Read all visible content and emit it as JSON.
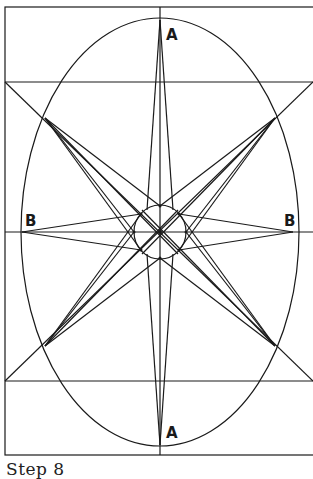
{
  "caption": "Step 8",
  "labels": {
    "top_point": "A",
    "bottom_point": "A",
    "left_point": "B",
    "right_point": "B"
  },
  "colors": {
    "stroke": "#1a1a1a",
    "background": "#ffffff"
  },
  "geometry": {
    "outer_rect": {
      "x1": 5,
      "y1": 7,
      "x2": 313,
      "y2": 455
    },
    "upper_band_y": 82,
    "lower_band_y": 381,
    "center": {
      "x": 160,
      "y": 232
    },
    "ellipse": {
      "cx": 160,
      "cy": 232,
      "rx": 139,
      "ry": 214
    },
    "inner_circle": {
      "cx": 160,
      "cy": 232,
      "r": 26
    },
    "points": {
      "A_top": [
        160,
        20
      ],
      "A_bottom": [
        160,
        445
      ],
      "B_left": [
        22,
        232
      ],
      "B_right": [
        293,
        232
      ],
      "diag_upper_left": [
        45,
        118
      ],
      "diag_upper_right": [
        275,
        118
      ],
      "diag_lower_left": [
        45,
        346
      ],
      "diag_lower_right": [
        275,
        346
      ]
    }
  }
}
